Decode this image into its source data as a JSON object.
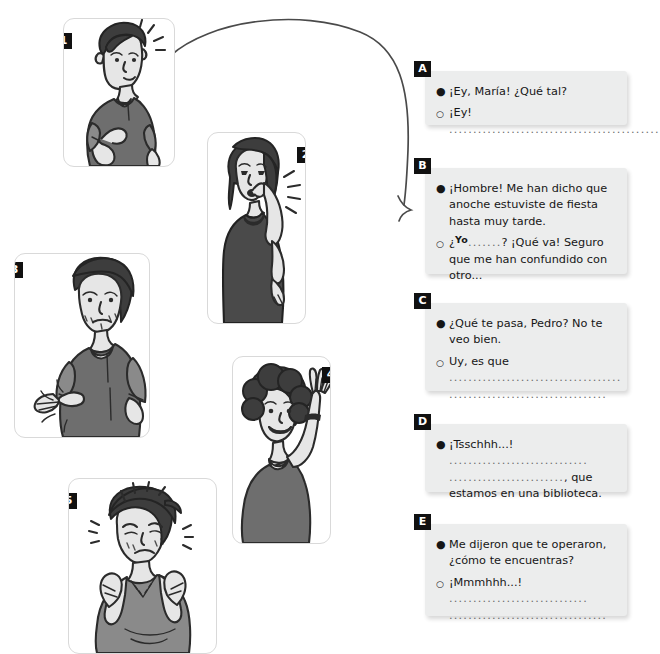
{
  "page": {
    "top_clipped_text": "",
    "background_color": "#ffffff",
    "badge_color": "#111111",
    "box_color": "#eceded"
  },
  "panels": [
    {
      "number": "1",
      "icon": "man-pointing-at-himself-surprised",
      "description": "Young man with dark hair pointing at his own chest, mouth open, emphasis lines at head"
    },
    {
      "number": "2",
      "icon": "woman-shushing-finger-to-lips",
      "description": "Woman with long hair holding index finger to her lips, frowning, emphasis lines"
    },
    {
      "number": "3",
      "icon": "man-so-so-hand-gesture",
      "description": "Unshaven man looking unwell, tilting open hand side to side with motion lines"
    },
    {
      "number": "4",
      "icon": "woman-waving-hello",
      "description": "Smiling woman with curly hair waving her raised hand"
    },
    {
      "number": "5",
      "icon": "man-holding-head-in-pain",
      "description": "Man in t-shirt holding both hands to his head, eyes shut, pain lines"
    }
  ],
  "connector": {
    "icon": "curved-arrow",
    "from_panel": "1",
    "to_box": "B"
  },
  "dialogues": [
    {
      "label": "A",
      "lines": [
        {
          "marker": "filled",
          "parts": [
            {
              "type": "text",
              "value": "¡Ey, María! ¿Qué tal?"
            }
          ]
        },
        {
          "marker": "hollow",
          "parts": [
            {
              "type": "text",
              "value": "¡Ey! "
            },
            {
              "type": "dots",
              "value": "............................................"
            }
          ]
        }
      ]
    },
    {
      "label": "B",
      "lines": [
        {
          "marker": "filled",
          "parts": [
            {
              "type": "text",
              "value": "¡Hombre! Me han dicho que anoche estuviste de fiesta hasta muy tarde."
            }
          ]
        },
        {
          "marker": "hollow",
          "parts": [
            {
              "type": "text",
              "value": "¿"
            },
            {
              "type": "handwritten",
              "value": "Yo"
            },
            {
              "type": "dots",
              "value": "......."
            },
            {
              "type": "text",
              "value": "? ¡Qué va! Seguro que me han confundido con otro..."
            }
          ]
        }
      ]
    },
    {
      "label": "C",
      "lines": [
        {
          "marker": "filled",
          "parts": [
            {
              "type": "text",
              "value": "¿Qué te pasa, Pedro? No te veo bien."
            }
          ]
        },
        {
          "marker": "hollow",
          "parts": [
            {
              "type": "text",
              "value": "Uy, es que "
            },
            {
              "type": "dots",
              "value": "...................................."
            },
            {
              "type": "break"
            },
            {
              "type": "dots",
              "value": "................................."
            }
          ]
        }
      ]
    },
    {
      "label": "D",
      "lines": [
        {
          "marker": "filled",
          "parts": [
            {
              "type": "text",
              "value": "¡Tsschhh...! "
            },
            {
              "type": "dots",
              "value": "............................."
            },
            {
              "type": "break"
            },
            {
              "type": "dots",
              "value": "........................"
            },
            {
              "type": "text",
              "value": ", que estamos en una biblioteca."
            }
          ]
        }
      ]
    },
    {
      "label": "E",
      "lines": [
        {
          "marker": "filled",
          "parts": [
            {
              "type": "text",
              "value": "Me dijeron que te operaron, ¿cómo te encuentras?"
            }
          ]
        },
        {
          "marker": "hollow",
          "parts": [
            {
              "type": "text",
              "value": "¡Mmmhhh...! "
            },
            {
              "type": "dots",
              "value": "............................."
            },
            {
              "type": "break"
            },
            {
              "type": "dots",
              "value": "................................."
            }
          ]
        }
      ]
    }
  ]
}
